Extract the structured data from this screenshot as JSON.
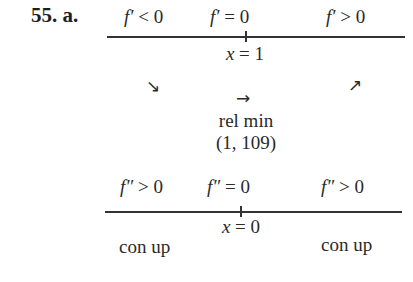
{
  "problem": {
    "label": "55. a."
  },
  "first_derivative_chart": {
    "signs": [
      {
        "symbol": "f′",
        "relation": "< 0"
      },
      {
        "symbol": "f′",
        "relation": "= 0"
      },
      {
        "symbol": "f′",
        "relation": "> 0"
      }
    ],
    "critical_point": {
      "var": "x",
      "value": "= 1"
    },
    "behavior_arrows": [
      "↘",
      "→",
      "↗"
    ],
    "conclusion": {
      "label": "rel min",
      "point": "(1, 109)"
    }
  },
  "second_derivative_chart": {
    "signs": [
      {
        "symbol": "f″",
        "relation": "> 0"
      },
      {
        "symbol": "f″",
        "relation": "= 0"
      },
      {
        "symbol": "f″",
        "relation": "> 0"
      }
    ],
    "critical_point": {
      "var": "x",
      "value": "= 0"
    },
    "concavity": [
      "con up",
      "con up"
    ]
  }
}
